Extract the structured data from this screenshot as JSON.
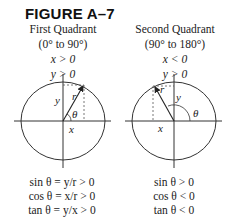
{
  "figure": {
    "title": "FIGURE A–7"
  },
  "panels": [
    {
      "heading": "First Quadrant",
      "range": "(0° to 90°)",
      "conditions": [
        "x > 0",
        "y > 0"
      ],
      "labels": {
        "r": "r",
        "x": "x",
        "y": "y",
        "theta": "θ"
      },
      "equations": [
        "sin θ = y/r > 0",
        "cos θ = x/r > 0",
        "tan θ = y/x > 0"
      ]
    },
    {
      "heading": "Second Quadrant",
      "range": "(90° to 180°)",
      "conditions": [
        "x < 0",
        "y > 0"
      ],
      "labels": {
        "r": "r",
        "x": "x",
        "y": "y",
        "theta": "θ"
      },
      "equations": [
        "sin θ > 0",
        "cos θ < 0",
        "tan θ < 0"
      ]
    }
  ],
  "colors": {
    "ink": "#222222",
    "background": "#ffffff"
  }
}
